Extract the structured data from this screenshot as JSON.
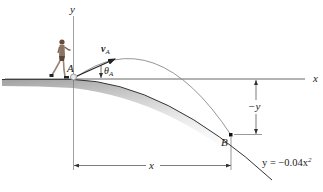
{
  "diagram": {
    "axes": {
      "x_label": "x",
      "y_label": "y"
    },
    "points": {
      "A": {
        "label": "A"
      },
      "B": {
        "label": "B"
      }
    },
    "velocity": {
      "label": "v",
      "subscript": "A"
    },
    "angle": {
      "label": "θ",
      "subscript": "A"
    },
    "dimensions": {
      "horizontal_label": "x",
      "vertical_label": "−y"
    },
    "equation": {
      "lhs": "y = −0.04x",
      "exponent": "2"
    },
    "colors": {
      "line": "#333333",
      "trajectory": "#8a8a8a",
      "ground_shade": "#9a9a9a"
    }
  }
}
